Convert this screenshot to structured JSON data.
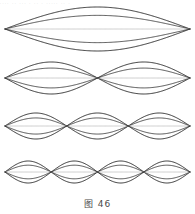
{
  "figure": {
    "caption": "图 46",
    "caption_label": "图",
    "caption_number": "46",
    "top_partial_text": "....  .. ... . .. . ..... .. .",
    "background_color": "#ffffff",
    "stroke_color": "#2b2b2b",
    "faint_stroke_color": "#b8b8b8",
    "width": 195,
    "height": 214
  },
  "chart_data": {
    "type": "line",
    "title": "图 46",
    "xlabel": "",
    "ylabel": "",
    "xlim": [
      0,
      1
    ],
    "ylim": [
      -1,
      1
    ],
    "grid": false,
    "legend": false,
    "string_endpoints_px": [
      5,
      190
    ],
    "phase_factors": [
      1,
      0.62,
      0.0,
      -0.62,
      -1
    ],
    "series": [
      {
        "name": "harmonic-1",
        "harmonic": 1,
        "loops": 1,
        "nodes": 2,
        "antinodes": 1,
        "center_y_px": 29,
        "amplitude_px": 22,
        "node_positions_px": [
          5,
          190
        ],
        "antinode_positions_px": [
          97.5
        ],
        "traces": 5
      },
      {
        "name": "harmonic-2",
        "harmonic": 2,
        "loops": 2,
        "nodes": 3,
        "antinodes": 2,
        "center_y_px": 78,
        "amplitude_px": 16,
        "node_positions_px": [
          5,
          97.5,
          190
        ],
        "antinode_positions_px": [
          51.25,
          143.75
        ],
        "traces": 5
      },
      {
        "name": "harmonic-3",
        "harmonic": 3,
        "loops": 3,
        "nodes": 4,
        "antinodes": 3,
        "center_y_px": 126,
        "amplitude_px": 13,
        "node_positions_px": [
          5,
          66.67,
          128.33,
          190
        ],
        "antinode_positions_px": [
          35.83,
          97.5,
          159.17
        ],
        "traces": 5
      },
      {
        "name": "harmonic-4",
        "harmonic": 4,
        "loops": 4,
        "nodes": 5,
        "antinodes": 4,
        "center_y_px": 172,
        "amplitude_px": 11,
        "node_positions_px": [
          5,
          51.25,
          97.5,
          143.75,
          190
        ],
        "antinode_positions_px": [
          28.13,
          74.38,
          120.63,
          166.88
        ],
        "traces": 5
      }
    ]
  }
}
